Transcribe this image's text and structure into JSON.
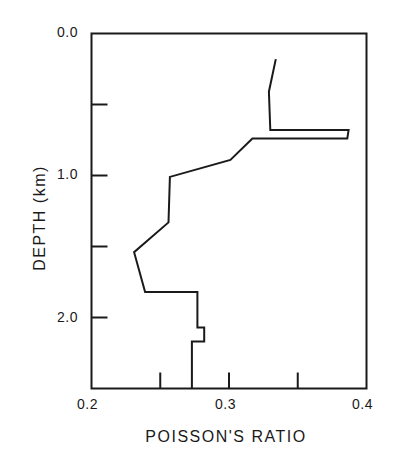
{
  "chart_data": {
    "type": "line",
    "title": "",
    "xlabel": "POISSON'S RATIO",
    "ylabel": "DEPTH (km)",
    "xlim": [
      0.2,
      0.4
    ],
    "ylim": [
      2.5,
      0.0
    ],
    "y_inverted": true,
    "grid": false,
    "legend": null,
    "x_ticks": [
      0.2,
      0.25,
      0.3,
      0.35,
      0.4
    ],
    "x_tick_labels": [
      "0.2",
      "",
      "0.3",
      "",
      "0.4"
    ],
    "y_ticks": [
      0.0,
      0.5,
      1.0,
      1.5,
      2.0,
      2.5
    ],
    "y_tick_labels": [
      "0.0",
      "",
      "1.0",
      "",
      "2.0",
      ""
    ],
    "series": [
      {
        "name": "Poisson's ratio profile",
        "color": "#1a1a1a",
        "points": [
          {
            "x": 0.334,
            "y": 0.18
          },
          {
            "x": 0.329,
            "y": 0.41
          },
          {
            "x": 0.33,
            "y": 0.68
          },
          {
            "x": 0.387,
            "y": 0.68
          },
          {
            "x": 0.386,
            "y": 0.74
          },
          {
            "x": 0.317,
            "y": 0.74
          },
          {
            "x": 0.301,
            "y": 0.89
          },
          {
            "x": 0.257,
            "y": 1.01
          },
          {
            "x": 0.256,
            "y": 1.33
          },
          {
            "x": 0.231,
            "y": 1.54
          },
          {
            "x": 0.239,
            "y": 1.82
          },
          {
            "x": 0.277,
            "y": 1.82
          },
          {
            "x": 0.277,
            "y": 2.07
          },
          {
            "x": 0.282,
            "y": 2.07
          },
          {
            "x": 0.282,
            "y": 2.17
          },
          {
            "x": 0.273,
            "y": 2.17
          },
          {
            "x": 0.273,
            "y": 2.5
          }
        ]
      }
    ]
  },
  "labels": {
    "xlabel": "POISSON'S RATIO",
    "ylabel": "DEPTH (km)",
    "y_0": "0.0",
    "y_1": "1.0",
    "y_2": "2.0",
    "x_02": "0.2",
    "x_03": "0.3",
    "x_04": "0.4"
  }
}
